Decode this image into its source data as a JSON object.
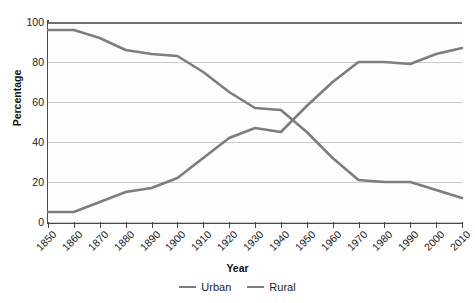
{
  "chart_data": {
    "type": "line",
    "title": "",
    "xlabel": "Year",
    "ylabel": "Percentage",
    "xlim": [
      1850,
      2010
    ],
    "ylim": [
      0,
      100
    ],
    "yticks": [
      0,
      20,
      40,
      60,
      80,
      100
    ],
    "grid": true,
    "legend_position": "bottom-center",
    "categories": [
      1850,
      1860,
      1870,
      1880,
      1890,
      1900,
      1910,
      1920,
      1930,
      1940,
      1950,
      1960,
      1970,
      1980,
      1990,
      2000,
      2010
    ],
    "x": [
      1850,
      1860,
      1870,
      1880,
      1890,
      1900,
      1910,
      1920,
      1930,
      1940,
      1950,
      1960,
      1970,
      1980,
      1990,
      2000,
      2010
    ],
    "series": [
      {
        "name": "Urban",
        "color": "#7d7d7d",
        "values": [
          5,
          5,
          10,
          15,
          17,
          22,
          32,
          42,
          47,
          45,
          58,
          70,
          80,
          80,
          79,
          84,
          87
        ]
      },
      {
        "name": "Rural",
        "color": "#7d7d7d",
        "values": [
          96,
          96,
          92,
          86,
          84,
          83,
          75,
          65,
          57,
          56,
          45,
          32,
          21,
          20,
          20,
          16,
          12
        ]
      }
    ]
  },
  "axes": {
    "y_title": "Percentage",
    "x_title": "Year",
    "y_tick_labels": [
      "100",
      "80",
      "60",
      "40",
      "20",
      "0"
    ],
    "x_tick_labels": [
      "1850",
      "1860",
      "1870",
      "1880",
      "1890",
      "1900",
      "1910",
      "1920",
      "1930",
      "1940",
      "1950",
      "1960",
      "1970",
      "1980",
      "1990",
      "2000",
      "2010"
    ]
  },
  "legend": {
    "items": [
      {
        "label": "Urban",
        "color": "#7d7d7d"
      },
      {
        "label": "Rural",
        "color": "#7d7d7d"
      }
    ]
  },
  "colors": {
    "series_gray": "#7d7d7d",
    "gridline": "#c9c9c9",
    "axis": "#4a4a4a",
    "text": "#1c1c1c",
    "background": "#fefefe"
  }
}
